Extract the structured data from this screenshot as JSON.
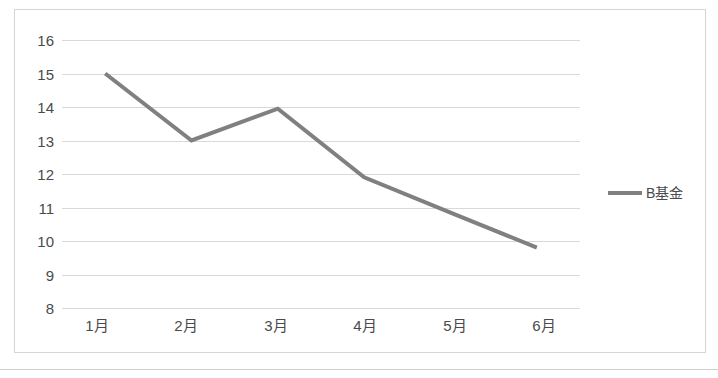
{
  "chart_data": {
    "type": "line",
    "title": "",
    "xlabel": "",
    "ylabel": "",
    "categories": [
      "1月",
      "2月",
      "3月",
      "4月",
      "5月",
      "6月"
    ],
    "series": [
      {
        "name": "B基金",
        "color": "#808080",
        "values": [
          15,
          13,
          13.95,
          11.9,
          10.85,
          9.8
        ]
      }
    ],
    "ylim": [
      8,
      16
    ],
    "ytick_step": 1,
    "yticks": [
      16,
      15,
      14,
      13,
      12,
      11,
      10,
      9,
      8
    ],
    "grid": true,
    "legend_position": "right",
    "legend": [
      {
        "label": "B基金",
        "marker": "line-swatch",
        "color": "#808080"
      }
    ]
  },
  "axes": {
    "y_tick_labels": [
      "16",
      "15",
      "14",
      "13",
      "12",
      "11",
      "10",
      "9",
      "8"
    ],
    "x_tick_labels": [
      "1月",
      "2月",
      "3月",
      "4月",
      "5月",
      "6月"
    ]
  },
  "legend": {
    "series_label": "B基金"
  },
  "style": {
    "line_color": "#808080",
    "gridline_color": "#d9d9d9",
    "frame_color": "#d6d6d6",
    "text_color": "#4a4a4a",
    "background": "#ffffff"
  }
}
